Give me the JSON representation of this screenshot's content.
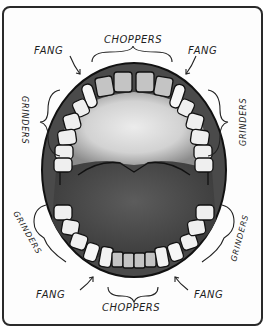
{
  "diagram": {
    "labels": {
      "top_choppers": "CHOPPERS",
      "top_fang_left": "FANG",
      "top_fang_right": "FANG",
      "upper_grinders_left": "GRINDERS",
      "upper_grinders_right": "GRINDERS",
      "lower_grinders_left": "GRINDERS",
      "lower_grinders_right": "GRINDERS",
      "bottom_fang_left": "FANG",
      "bottom_fang_right": "FANG",
      "bottom_choppers": "CHOPPERS"
    },
    "colors": {
      "mouth_dark": "#4a4a4a",
      "palate_light": "#d8d8d8",
      "tooth_white": "#f4f4f4",
      "tooth_gray": "#bdbdbd",
      "ink": "#1a1a1a"
    }
  }
}
